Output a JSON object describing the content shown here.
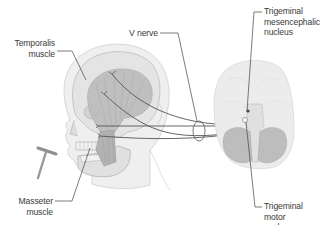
{
  "diagram": {
    "type": "anatomical-illustration",
    "colors": {
      "background": "#ffffff",
      "skin": "#eeeeee",
      "skin_outline": "#c9c9c9",
      "skull": "#e2e2e2",
      "muscle": "#b9b9b9",
      "brain": "#eaeaea",
      "cerebellum": "#bdbdbd",
      "nerve_line": "#555555",
      "leader_line": "#444444",
      "label_text": "#3a3a3a",
      "hammer": "#8f8f8f"
    },
    "labels": {
      "temporalis": {
        "lines": [
          "Temporalis",
          "muscle"
        ]
      },
      "masseter": {
        "lines": [
          "Masseter",
          "muscle"
        ]
      },
      "v_nerve": {
        "lines": [
          "V nerve"
        ]
      },
      "mesencephalic": {
        "lines": [
          "Trigeminal",
          "mesencephalic",
          "nucleus"
        ]
      },
      "motor": {
        "lines": [
          "Trigeminal",
          "motor",
          "nucleus"
        ]
      }
    },
    "elements": [
      "head-profile",
      "skull",
      "temporalis-muscle",
      "masseter-muscle",
      "reflex-hammer",
      "v-nerve-bundle",
      "nerve-loop-ellipse",
      "brain-inferior-view",
      "brainstem",
      "cerebellum"
    ]
  }
}
